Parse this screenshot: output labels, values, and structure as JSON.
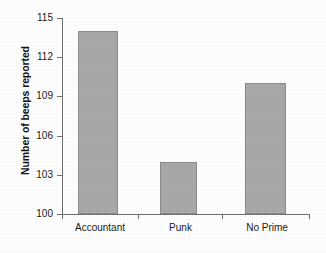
{
  "chart_data": {
    "type": "bar",
    "title": "",
    "xlabel": "",
    "ylabel": "Number of beeps reported",
    "categories": [
      "Accountant",
      "Punk",
      "No Prime"
    ],
    "values": [
      114,
      104,
      110
    ],
    "ylim": [
      100,
      115
    ],
    "yticks": [
      100,
      103,
      106,
      109,
      112,
      115
    ],
    "ytick_labels": [
      "100",
      "103",
      "106",
      "109",
      "112",
      "115"
    ],
    "grid": false,
    "legend": null,
    "bar_color": "#a9a9a9",
    "bar_edge_color": "#8d8d8d",
    "axis_color": "#6f6f6f",
    "background": "#ffffff"
  }
}
